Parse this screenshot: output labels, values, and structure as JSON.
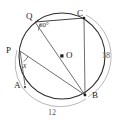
{
  "figure": {
    "type": "circle-geometry-diagram",
    "stroke_color": "#2b2b2b",
    "arc_color": "#a8a8a8",
    "background": "#ffffff"
  },
  "circle": {
    "center_label": "O",
    "center_x": 62,
    "center_y": 56,
    "radius": 43
  },
  "points": [
    {
      "id": "Q",
      "label": "Q",
      "x": 35,
      "y": 22,
      "label_x": 26,
      "label_y": 12,
      "marker": false
    },
    {
      "id": "C",
      "label": "C",
      "x": 84,
      "y": 18,
      "label_x": 77,
      "label_y": 9,
      "marker": true
    },
    {
      "id": "P",
      "label": "P",
      "x": 20,
      "y": 51,
      "label_x": 7,
      "label_y": 46,
      "marker": false
    },
    {
      "id": "A",
      "label": "A",
      "x": 25,
      "y": 85,
      "label_x": 14,
      "label_y": 81,
      "marker": true
    },
    {
      "id": "B",
      "label": "B",
      "x": 85,
      "y": 95,
      "label_x": 92,
      "label_y": 92,
      "marker": true
    },
    {
      "id": "O",
      "label": "O",
      "x": 62,
      "y": 56,
      "label_x": 66,
      "label_y": 51,
      "marker": true
    }
  ],
  "chords": [
    {
      "from": "Q",
      "to": "B",
      "name": "chord-q-b"
    },
    {
      "from": "C",
      "to": "B",
      "name": "chord-c-b"
    },
    {
      "from": "P",
      "to": "B",
      "name": "chord-p-b"
    },
    {
      "from": "P",
      "to": "A",
      "name": "chord-p-a"
    },
    {
      "from": "Q",
      "to": "C",
      "name": "chord-q-c"
    }
  ],
  "angles": [
    {
      "id": "angle-at-q",
      "label": "60°",
      "vertex": "Q",
      "label_x": 39,
      "label_y": 22
    },
    {
      "id": "angle-at-p",
      "label": "x",
      "vertex": "P",
      "label_x": 23,
      "label_y": 63
    }
  ],
  "arc_labels": [
    {
      "id": "arc-cb-length",
      "label": "18",
      "x": 102,
      "y": 53,
      "arc_from": "C",
      "arc_to": "B"
    },
    {
      "id": "arc-ab-length",
      "label": "12",
      "x": 49,
      "y": 110,
      "arc_from": "A",
      "arc_to": "B"
    }
  ]
}
